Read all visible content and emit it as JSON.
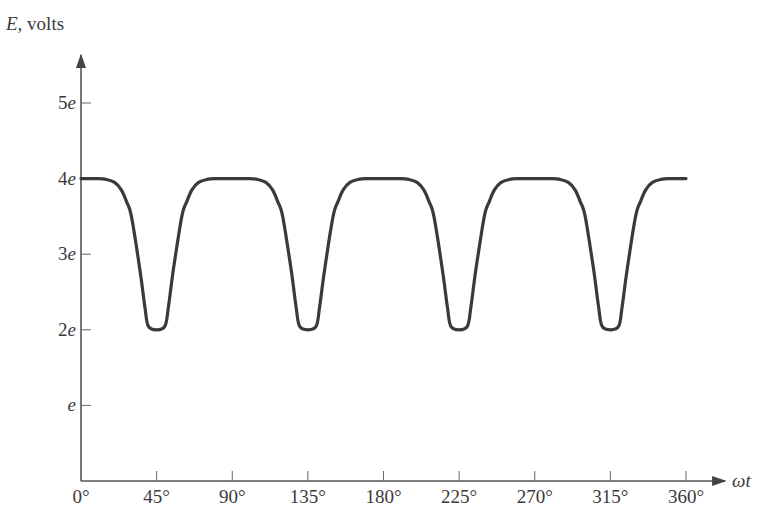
{
  "chart_data": {
    "type": "line",
    "title": "",
    "ylabel": "E, volts",
    "ylabel_var": "E",
    "ylabel_unit": ", volts",
    "xlabel": "ωt",
    "x_ticks": [
      0,
      45,
      90,
      135,
      180,
      225,
      270,
      315,
      360
    ],
    "x_tick_labels": [
      "0°",
      "45°",
      "90°",
      "135°",
      "180°",
      "225°",
      "270°",
      "315°",
      "360°"
    ],
    "y_ticks": [
      1,
      2,
      3,
      4,
      5
    ],
    "y_tick_labels": [
      "e",
      "2e",
      "3e",
      "4e",
      "5e"
    ],
    "xlim": [
      0,
      360
    ],
    "ylim": [
      0,
      5.5
    ],
    "grid": false,
    "legend": null,
    "series": [
      {
        "name": "E",
        "description": "Constant 4e with narrow dips to 2e centered at 45°, 135°, 225°, 315°",
        "baseline": 4,
        "dip_min": 2,
        "dip_centers": [
          45,
          135,
          225,
          315
        ],
        "x": [
          0,
          10,
          15,
          20,
          24,
          27,
          30,
          35,
          38,
          40,
          45,
          50,
          52,
          55,
          60,
          63,
          66,
          70,
          75,
          80,
          90,
          100,
          105,
          110,
          114,
          117,
          120,
          125,
          128,
          130,
          135,
          140,
          142,
          145,
          150,
          153,
          156,
          160,
          165,
          170,
          180,
          190,
          195,
          200,
          204,
          207,
          210,
          215,
          218,
          220,
          225,
          230,
          232,
          235,
          240,
          243,
          246,
          250,
          255,
          260,
          270,
          280,
          285,
          290,
          294,
          297,
          300,
          305,
          308,
          310,
          315,
          320,
          322,
          325,
          330,
          333,
          336,
          340,
          345,
          350,
          360
        ],
        "values": [
          4,
          4,
          3.99,
          3.95,
          3.85,
          3.7,
          3.5,
          2.8,
          2.3,
          2.05,
          2,
          2.05,
          2.3,
          2.8,
          3.5,
          3.7,
          3.85,
          3.95,
          3.99,
          4,
          4,
          4,
          3.99,
          3.95,
          3.85,
          3.7,
          3.5,
          2.8,
          2.3,
          2.05,
          2,
          2.05,
          2.3,
          2.8,
          3.5,
          3.7,
          3.85,
          3.95,
          3.99,
          4,
          4,
          4,
          3.99,
          3.95,
          3.85,
          3.7,
          3.5,
          2.8,
          2.3,
          2.05,
          2,
          2.05,
          2.3,
          2.8,
          3.5,
          3.7,
          3.85,
          3.95,
          3.99,
          4,
          4,
          4,
          3.99,
          3.95,
          3.85,
          3.7,
          3.5,
          2.8,
          2.3,
          2.05,
          2,
          2.05,
          2.3,
          2.8,
          3.5,
          3.7,
          3.85,
          3.95,
          3.99,
          4,
          4
        ]
      }
    ],
    "colors": {
      "line": "#3a3a3a",
      "axis": "#555555"
    }
  }
}
